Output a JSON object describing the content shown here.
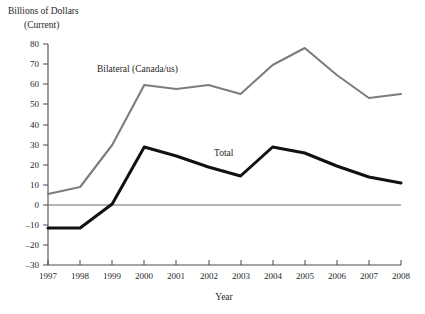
{
  "chart_data": {
    "type": "line",
    "title": "",
    "header_lines": [
      "Billions of Dollars",
      "(Current)"
    ],
    "xlabel": "Year",
    "ylabel": "Billions of Dollars (Current)",
    "categories": [
      "1997",
      "1998",
      "1999",
      "2000",
      "2001",
      "2002",
      "2003",
      "2004",
      "2005",
      "2006",
      "2007",
      "2008"
    ],
    "x": [
      1997,
      1998,
      1999,
      2000,
      2001,
      2002,
      2003,
      2004,
      2005,
      2006,
      2007,
      2008
    ],
    "xlim": [
      1997,
      2008
    ],
    "ylim": [
      -30,
      80
    ],
    "yticks": [
      80,
      70,
      60,
      50,
      40,
      30,
      20,
      10,
      0,
      -10,
      -20,
      -30
    ],
    "ytick_labels": [
      "80",
      "70",
      "60",
      "50",
      "40",
      "30",
      "20",
      "10",
      "0",
      "–10",
      "–20",
      "–30"
    ],
    "xtick_labels": [
      "1997",
      "1998",
      "1999",
      "2000",
      "2001",
      "2002",
      "2003",
      "2004",
      "2005",
      "2006",
      "2007",
      "2008"
    ],
    "grid": false,
    "legend_position": "inline-annotation",
    "zero_line": true,
    "series": [
      {
        "name": "Bilateral (Canada/us)",
        "label": "Bilateral (Canada/us)",
        "color": "#7d7d7d",
        "values": [
          5.5,
          9,
          30,
          60,
          58,
          60,
          55.5,
          70,
          78.5,
          65,
          53.5,
          55.5
        ]
      },
      {
        "name": "Total",
        "label": "Total",
        "color": "#111111",
        "values": [
          -11.5,
          -11.5,
          0.5,
          29,
          24.5,
          19,
          14.5,
          29,
          26,
          19.5,
          14,
          11
        ]
      }
    ],
    "annotations": [
      {
        "text": "Bilateral (Canada/us)",
        "x_px": 97,
        "y_px": 72
      },
      {
        "text": "Total",
        "x_px": 214,
        "y_px": 156
      }
    ],
    "colors": {
      "bilateral": "#7d7d7d",
      "total": "#111111",
      "axis": "#4a4a4a",
      "zero_line": "#6b6b6b",
      "background": "#ffffff"
    }
  }
}
